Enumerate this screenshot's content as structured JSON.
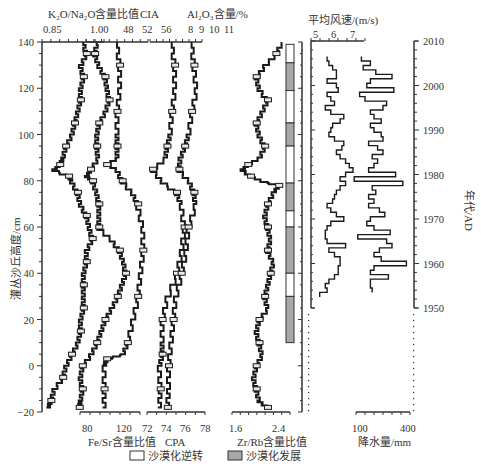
{
  "chart_data": [
    {
      "type": "line",
      "title": "",
      "ylabel": "灌丛沙丘高度/cm",
      "ylim": [
        -20,
        140
      ],
      "yticks": [
        140,
        120,
        100,
        80,
        60,
        40,
        20,
        0,
        -20
      ],
      "panels": [
        {
          "name": "K2O/Na2O含量比值",
          "axis_position": "top",
          "ticks": [
            0.85,
            1.0
          ],
          "xlim": [
            0.83,
            1.04
          ],
          "series": {
            "depth": [
              140,
              135,
              130,
              125,
              120,
              115,
              110,
              105,
              100,
              95,
              90,
              87,
              85,
              82,
              80,
              75,
              70,
              65,
              60,
              55,
              50,
              45,
              40,
              35,
              30,
              25,
              20,
              15,
              10,
              5,
              0,
              -5,
              -10,
              -15,
              -18
            ],
            "values": [
              0.97,
              0.98,
              0.96,
              0.97,
              0.96,
              0.96,
              0.95,
              0.94,
              0.93,
              0.91,
              0.9,
              0.89,
              0.87,
              0.92,
              0.93,
              0.95,
              0.96,
              0.98,
              0.99,
              1.0,
              0.98,
              0.98,
              0.97,
              0.97,
              0.97,
              0.97,
              0.96,
              0.96,
              0.95,
              0.93,
              0.91,
              0.9,
              0.87,
              0.86,
              0.85
            ]
          }
        },
        {
          "name": "Fe/Sr含量比值",
          "axis_position": "bottom",
          "ticks": [
            80,
            120
          ],
          "xlim": [
            72,
            140
          ],
          "series": {
            "depth": [
              140,
              135,
              130,
              125,
              120,
              115,
              110,
              105,
              100,
              95,
              90,
              85,
              82,
              80,
              75,
              70,
              65,
              60,
              55,
              50,
              45,
              40,
              35,
              30,
              25,
              20,
              15,
              10,
              5,
              0,
              -5,
              -10,
              -15,
              -18
            ],
            "values": [
              96,
              94,
              98,
              104,
              106,
              108,
              104,
              98,
              96,
              96,
              97,
              90,
              86,
              92,
              96,
              98,
              98,
              98,
              110,
              118,
              122,
              124,
              120,
              116,
              110,
              104,
              100,
              96,
              90,
              82,
              80,
              82,
              80,
              79
            ]
          }
        },
        {
          "name": "CIA",
          "axis_position": "top",
          "ticks": [
            48,
            52,
            56
          ],
          "xlim": [
            46,
            58
          ],
          "series": {
            "depth": [
              140,
              130,
              120,
              110,
              100,
              95,
              90,
              87,
              85,
              80,
              75,
              70,
              60,
              50,
              40,
              30,
              20,
              10,
              5,
              3,
              0,
              -10,
              -18
            ],
            "values": [
              52,
              52.5,
              52.5,
              52,
              52,
              52,
              52,
              50,
              52,
              53,
              55,
              56,
              57,
              57,
              56.5,
              56,
              55,
              54,
              53,
              50,
              49.5,
              49.5,
              49.5
            ]
          }
        },
        {
          "name": "CPA",
          "axis_position": "bottom",
          "ticks": [
            72,
            74,
            76,
            78
          ],
          "xlim": [
            71.5,
            78.5
          ],
          "series": {
            "depth": [
              140,
              130,
              120,
              110,
              100,
              95,
              90,
              85,
              80,
              75,
              70,
              60,
              50,
              40,
              30,
              20,
              10,
              5,
              0,
              -10,
              -18
            ],
            "values": [
              74.5,
              74.8,
              74.8,
              74.5,
              74.3,
              74,
              73.8,
              72.5,
              73.5,
              75,
              75.5,
              75.8,
              75.5,
              75,
              74,
              73.5,
              73.5,
              73.5,
              73.2,
              73.3,
              73.2
            ]
          }
        },
        {
          "name": "Al2O3含量/%",
          "axis_position": "top",
          "ticks": [
            8,
            9,
            10,
            11
          ],
          "xlim": [
            7,
            11.5
          ],
          "series": {
            "depth": [
              140,
              130,
              120,
              110,
              100,
              95,
              90,
              85,
              80,
              75,
              70,
              60,
              50,
              40,
              30,
              20,
              10,
              0,
              -10,
              -18
            ],
            "values": [
              10.6,
              10.8,
              11,
              10.6,
              10.3,
              10,
              9.6,
              9.5,
              10.4,
              10.8,
              10.9,
              10.3,
              10.1,
              9.7,
              9.2,
              9,
              8.8,
              8.6,
              8.6,
              8.5
            ]
          }
        },
        {
          "name": "Zr/Rb含量比值",
          "axis_position": "bottom",
          "ticks": [
            1.6,
            2.4
          ],
          "xlim": [
            1.5,
            2.6
          ],
          "series": {
            "depth": [
              140,
              135,
              130,
              125,
              120,
              115,
              110,
              105,
              100,
              95,
              90,
              87,
              85,
              82,
              80,
              78,
              75,
              70,
              65,
              60,
              55,
              50,
              45,
              40,
              35,
              30,
              25,
              20,
              15,
              10,
              5,
              0,
              -5,
              -10,
              -15,
              -18
            ],
            "values": [
              2.45,
              2.35,
              2.15,
              2.0,
              2.05,
              2.2,
              2.1,
              2.0,
              2.05,
              2.15,
              2.05,
              1.85,
              1.75,
              1.9,
              2.1,
              2.4,
              2.3,
              2.2,
              2.15,
              2.2,
              2.25,
              2.2,
              2.3,
              2.25,
              2.2,
              2.15,
              2.2,
              2.05,
              2.0,
              2.05,
              2.1,
              2.0,
              1.95,
              2.0,
              2.05,
              2.2
            ]
          }
        }
      ],
      "bands": [
        {
          "from": 139,
          "to": 131,
          "type": "沙漠化逆转"
        },
        {
          "from": 131,
          "to": 119,
          "type": "沙漠化发展"
        },
        {
          "from": 119,
          "to": 105,
          "type": "沙漠化逆转"
        },
        {
          "from": 105,
          "to": 95,
          "type": "沙漠化发展"
        },
        {
          "from": 95,
          "to": 79,
          "type": "沙漠化逆转"
        },
        {
          "from": 79,
          "to": 67,
          "type": "沙漠化发展"
        },
        {
          "from": 67,
          "to": 60,
          "type": "沙漠化逆转"
        },
        {
          "from": 60,
          "to": 40,
          "type": "沙漠化发展"
        },
        {
          "from": 40,
          "to": 30,
          "type": "沙漠化逆转"
        },
        {
          "from": 30,
          "to": 10,
          "type": "沙漠化发展"
        }
      ]
    },
    {
      "type": "line",
      "title": "",
      "ylabel": "年代/AD",
      "ylim": [
        1950,
        2010
      ],
      "yticks": [
        2010,
        2000,
        1990,
        1980,
        1970,
        1960,
        1950
      ],
      "panels": [
        {
          "name": "平均风速/(m/s)",
          "axis_position": "top",
          "ticks": [
            5,
            6,
            7
          ],
          "xlim": [
            4.7,
            7.6
          ],
          "series": {
            "year": [
              2006,
              2005,
              2004,
              2003,
              2002,
              2001,
              2000,
              1999,
              1998,
              1997,
              1996,
              1995,
              1994,
              1993,
              1992,
              1991,
              1990,
              1989,
              1988,
              1987,
              1986,
              1985,
              1984,
              1983,
              1982,
              1981,
              1980,
              1979,
              1978,
              1977,
              1976,
              1975,
              1974,
              1973,
              1972,
              1971,
              1970,
              1969,
              1968,
              1967,
              1966,
              1965,
              1964,
              1963,
              1962,
              1961,
              1960,
              1959,
              1958,
              1957,
              1956,
              1955,
              1954,
              1953
            ],
            "values": [
              5.6,
              5.7,
              5.9,
              6.1,
              6.1,
              5.6,
              6.1,
              6.2,
              5.6,
              5.8,
              6.0,
              5.5,
              5.8,
              6.5,
              6.3,
              5.9,
              5.8,
              5.7,
              6.0,
              6.5,
              6.4,
              6.1,
              6.3,
              6.6,
              6.8,
              7.0,
              6.6,
              6.3,
              6.6,
              6.3,
              6.1,
              6.0,
              5.9,
              5.6,
              5.8,
              6.1,
              6.5,
              5.8,
              5.6,
              5.5,
              5.5,
              5.6,
              6.6,
              5.7,
              6.0,
              6.3,
              6.3,
              6.2,
              6.2,
              6.0,
              5.7,
              5.5,
              5.6,
              5.2
            ]
          }
        },
        {
          "name": "降水量/mm",
          "axis_position": "bottom",
          "ticks": [
            100,
            400
          ],
          "xlim": [
            0,
            420
          ],
          "series": {
            "year": [
              2006,
              2005,
              2004,
              2003,
              2002,
              2001,
              2000,
              1999,
              1998,
              1997,
              1996,
              1995,
              1994,
              1993,
              1992,
              1991,
              1990,
              1989,
              1988,
              1987,
              1986,
              1985,
              1984,
              1983,
              1982,
              1981,
              1980,
              1979,
              1978,
              1977,
              1976,
              1975,
              1974,
              1973,
              1972,
              1971,
              1970,
              1969,
              1968,
              1967,
              1966,
              1965,
              1964,
              1963,
              1962,
              1961,
              1960,
              1959,
              1958,
              1957,
              1956,
              1955,
              1954
            ],
            "values": [
              130,
              180,
              140,
              210,
              300,
              180,
              160,
              310,
              120,
              150,
              270,
              250,
              180,
              200,
              240,
              180,
              200,
              240,
              250,
              170,
              220,
              250,
              190,
              220,
              200,
              170,
              320,
              90,
              360,
              190,
              210,
              170,
              200,
              170,
              230,
              260,
              180,
              160,
              200,
              290,
              110,
              270,
              300,
              230,
              200,
              240,
              380,
              200,
              180,
              280,
              180,
              180,
              190
            ]
          }
        }
      ]
    }
  ],
  "axes": {
    "left": {
      "label": "灌丛沙丘高度/cm",
      "ticks": [
        "140",
        "120",
        "100",
        "80",
        "60",
        "40",
        "20",
        "0",
        "−20"
      ]
    },
    "right": {
      "label": "年代/AD",
      "ticks": [
        "2010",
        "2000",
        "1990",
        "1980",
        "1970",
        "1960",
        "1950"
      ]
    },
    "top_labels": {
      "k2o_title": "K₂O/Na₂O含量比值",
      "cia_title": "CIA",
      "al2o3_title": "Al₂O₃含量/%",
      "wind_title": "平均风速/(m/s)",
      "k2o_ticks": [
        "0.85",
        "1.00"
      ],
      "cia_ticks": [
        "48",
        "52",
        "56"
      ],
      "al2o3_ticks": [
        "8",
        "9",
        "10",
        "11"
      ],
      "wind_ticks": [
        "5",
        "6",
        "7"
      ]
    },
    "bottom_labels": {
      "fesr_title": "Fe/Sr含量比值",
      "cpa_title": "CPA",
      "zrrb_title": "Zr/Rb含量比值",
      "precip_title": "降水量/mm",
      "fesr_ticks": [
        "80",
        "120"
      ],
      "cpa_ticks": [
        "72",
        "74",
        "76",
        "78"
      ],
      "zrrb_ticks": [
        "1.6",
        "2.4"
      ],
      "precip_ticks": [
        "100",
        "400"
      ]
    }
  },
  "legend": {
    "reversal": "沙漠化逆转",
    "development": "沙漠化发展",
    "reversal_color": "#ffffff",
    "development_color": "#a8a8a8"
  },
  "colors": {
    "line": "#1a1a1a",
    "axis": "#333333",
    "band_gray": "#a8a8a8"
  }
}
